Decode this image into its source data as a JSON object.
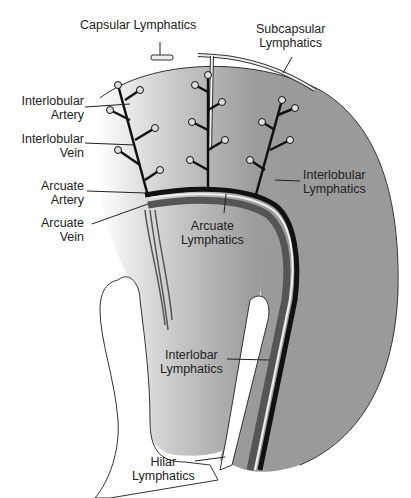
{
  "diagram": {
    "colors": {
      "parenchyma": "#9a9a9a",
      "background": "#ffffff",
      "vessel_dark": "#1a1a1a",
      "lymphatic": "#e8e8e8",
      "vein": "#555555"
    },
    "labels": {
      "capsular_lymphatics": "Capsular Lymphatics",
      "subcapsular_lymphatics_1": "Subcapsular",
      "subcapsular_lymphatics_2": "Lymphatics",
      "interlobular_artery_1": "Interlobular",
      "interlobular_artery_2": "Artery",
      "interlobular_vein_1": "Interlobular",
      "interlobular_vein_2": "Vein",
      "arcuate_artery_1": "Arcuate",
      "arcuate_artery_2": "Artery",
      "arcuate_vein_1": "Arcuate",
      "arcuate_vein_2": "Vein",
      "interlobular_lymphatics_1": "Interlobular",
      "interlobular_lymphatics_2": "Lymphatics",
      "arcuate_lymphatics_1": "Arcuate",
      "arcuate_lymphatics_2": "Lymphatics",
      "interlobar_lymphatics_1": "Interlobar",
      "interlobar_lymphatics_2": "Lymphatics",
      "hilar_lymphatics_1": "Hilar",
      "hilar_lymphatics_2": "Lymphatics"
    }
  }
}
